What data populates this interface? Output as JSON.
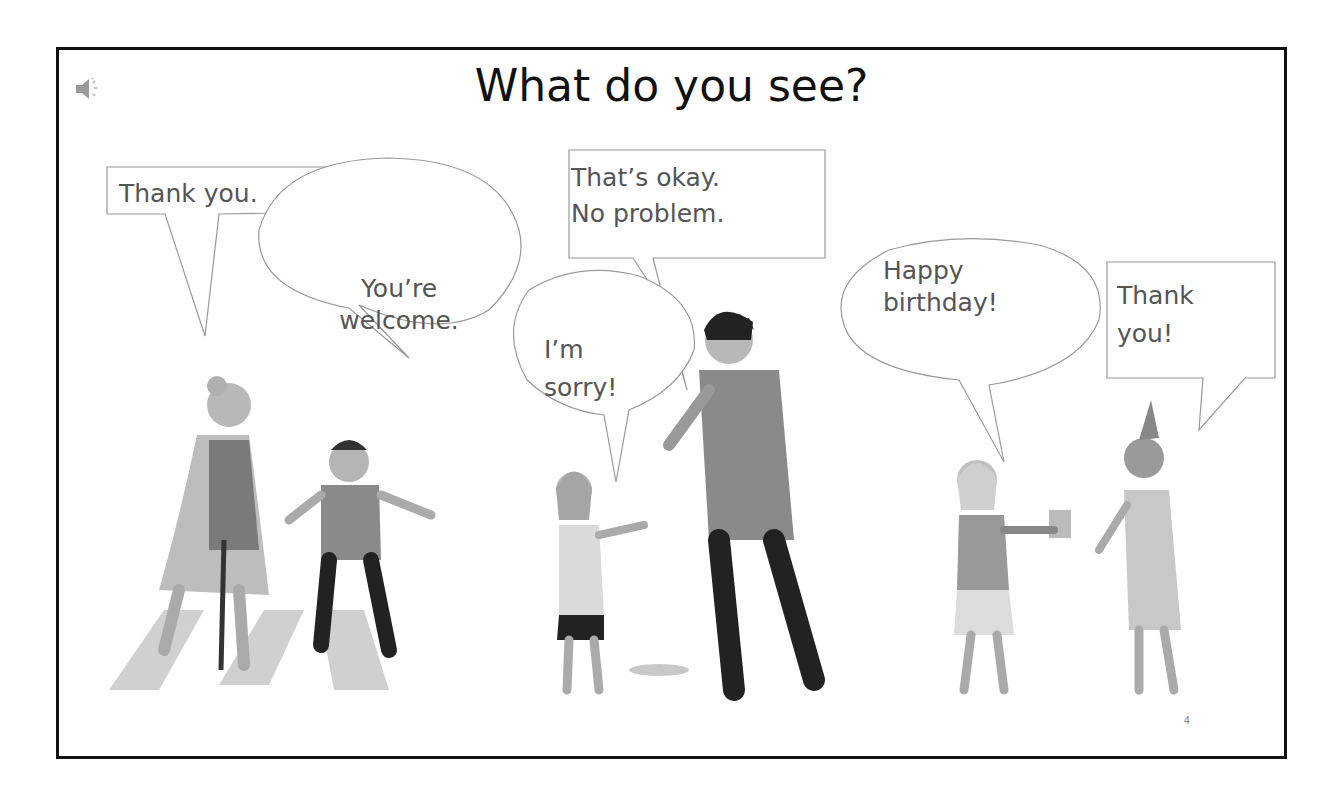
{
  "slide": {
    "title": "What do you see?",
    "page_number": "4",
    "audio_icon": "speaker-icon"
  },
  "bubbles": [
    {
      "id": "thank-you-1",
      "shape": "rectangle",
      "lines": [
        "Thank you."
      ]
    },
    {
      "id": "youre-welcome",
      "shape": "oval",
      "lines": [
        "You’re",
        "welcome."
      ]
    },
    {
      "id": "im-sorry",
      "shape": "oval",
      "lines": [
        "I’m",
        "sorry!"
      ]
    },
    {
      "id": "thats-okay",
      "shape": "rectangle",
      "lines": [
        "That’s okay.",
        "No problem."
      ]
    },
    {
      "id": "happy-birthday",
      "shape": "oval",
      "lines": [
        "Happy",
        "birthday!"
      ]
    },
    {
      "id": "thank-you-2",
      "shape": "rectangle",
      "lines": [
        "Thank",
        "you!"
      ]
    }
  ],
  "scenes": [
    {
      "name": "crossing-street",
      "figures": [
        "grandmother-with-cane",
        "boy-helping"
      ]
    },
    {
      "name": "apology",
      "figures": [
        "girl",
        "man-spilled"
      ]
    },
    {
      "name": "birthday",
      "figures": [
        "girl-with-gift",
        "girl-with-party-hat"
      ]
    }
  ]
}
